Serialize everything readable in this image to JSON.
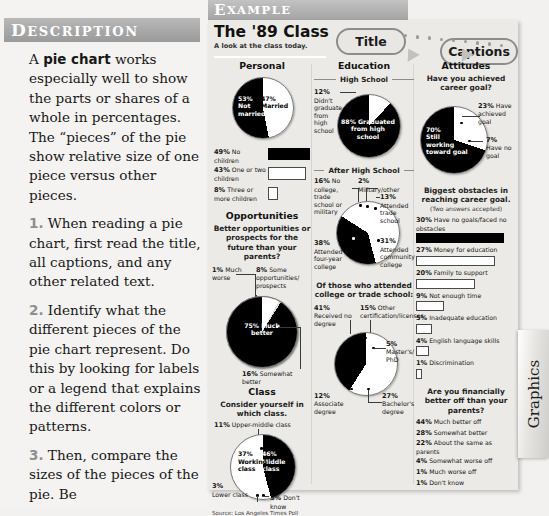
{
  "left": {
    "header": "DESCRIPTION",
    "paragraphs": [
      {
        "num": "",
        "html": "A <b>pie chart</b> works especially well to show the parts or shares of a whole in percentages. The “pieces” of the pie show relative size of one piece versus other pieces."
      },
      {
        "num": "1.",
        "html": "When reading a pie chart, first read the title, all captions, and any other related text."
      },
      {
        "num": "2.",
        "html": "Identify what the different pieces of the pie chart represent. Do this by looking for labels or a legend that explains the different colors or patterns."
      },
      {
        "num": "3.",
        "html": "Then, compare the sizes of the pieces of the pie. Be"
      }
    ]
  },
  "example": {
    "header": "EXAMPLE",
    "title": "The '89 Class",
    "subtitle": "A look at the class today.",
    "callouts": {
      "title_bubble": "Title",
      "captions_bubble": "Captions"
    },
    "source": "Source: Los Angeles Times Poll",
    "tab_label": "Graphics"
  },
  "chart_data": [
    {
      "type": "pie",
      "group": "Personal",
      "title": "Personal",
      "labels": [
        "47% Married",
        "53% Not married"
      ],
      "values": [
        47,
        53
      ],
      "colors": [
        "#ffffff",
        "#000000"
      ]
    },
    {
      "type": "bar",
      "group": "Personal",
      "title": "",
      "categories": [
        "49% No children",
        "43% One or two children",
        "8% Three or more children"
      ],
      "values": [
        49,
        43,
        8
      ],
      "pcts": [
        "49%",
        "43%",
        "8%"
      ],
      "texts": [
        "No children",
        "One or two children",
        "Three or more children"
      ],
      "fills": [
        "#000000",
        "#ffffff",
        "#ffffff"
      ]
    },
    {
      "type": "pie",
      "group": "Opportunities",
      "title": "Opportunities",
      "question": "Better opportunities or prospects for the future than your parents?",
      "labels": [
        "75% Much better",
        "16% Somewhat better",
        "8% Some opportunities/prospects",
        "1% Much worse"
      ],
      "values": [
        75,
        16,
        8,
        1
      ],
      "colors": [
        "#000000",
        "#ffffff",
        "#ffffff",
        "#ffffff"
      ]
    },
    {
      "type": "pie",
      "group": "Class",
      "title": "Class",
      "question": "Consider yourself in which class.",
      "labels": [
        "46% Middle class",
        "37% Working class",
        "11% Upper-middle class",
        "3% Lower class",
        "3% Don't know"
      ],
      "values": [
        46,
        37,
        11,
        3,
        3
      ],
      "colors": [
        "#000000",
        "#ffffff",
        "#ffffff",
        "#ffffff",
        "#ffffff"
      ]
    },
    {
      "type": "pie",
      "group": "Education",
      "title": "Education",
      "subhead": "High School",
      "labels": [
        "88% Graduated from high school",
        "12% Didn't graduate from high school"
      ],
      "values": [
        88,
        12
      ],
      "colors": [
        "#000000",
        "#ffffff"
      ]
    },
    {
      "type": "pie",
      "group": "Education",
      "subhead": "After High School",
      "labels": [
        "38% Attended a four-year college",
        "31% Attended community college",
        "16% No college, trade school or military",
        "13% Attended trade school",
        "2% Military/other"
      ],
      "values": [
        38,
        31,
        16,
        13,
        2
      ],
      "colors": [
        "#000000",
        "#ffffff",
        "#ffffff",
        "#ffffff",
        "#ffffff"
      ]
    },
    {
      "type": "pie",
      "group": "Education",
      "question": "Of those who attended college or trade school:",
      "labels": [
        "41% Received no degree",
        "27% Bachelor's degree",
        "15% Other certification/licenses",
        "12% Associate degree",
        "5% Master's/PhD"
      ],
      "values": [
        41,
        27,
        15,
        12,
        5
      ],
      "colors": [
        "#000000",
        "#ffffff",
        "#ffffff",
        "#ffffff",
        "#ffffff"
      ]
    },
    {
      "type": "pie",
      "group": "Attitudes",
      "title": "Attitudes",
      "question": "Have you achieved career goal?",
      "labels": [
        "70% Still working toward goal",
        "23% Have achieved goal",
        "7% Have no goal"
      ],
      "values": [
        70,
        23,
        7
      ],
      "colors": [
        "#000000",
        "#ffffff",
        "#ffffff"
      ]
    },
    {
      "type": "bar",
      "group": "Attitudes",
      "question": "Biggest obstacles in reaching career goal.",
      "question_note": "(Two answers accepted)",
      "categories": [
        "30% Have no goals/faced no obstacles",
        "27% Money for education",
        "20% Family to support",
        "9% Not enough time",
        "5% Inadequate education",
        "4% English language skills",
        "1% Discrimination"
      ],
      "values": [
        30,
        27,
        20,
        9,
        5,
        4,
        1
      ],
      "pcts": [
        "30%",
        "27%",
        "20%",
        "9%",
        "5%",
        "4%",
        "1%"
      ],
      "texts": [
        "Have no goals/faced no obstacles",
        "Money for education",
        "Family to support",
        "Not enough time",
        "Inadequate education",
        "English language skills",
        "Discrimination"
      ],
      "fills": [
        "#000000",
        "#ffffff",
        "#ffffff",
        "#ffffff",
        "#ffffff",
        "#ffffff",
        "#ffffff"
      ]
    },
    {
      "type": "table",
      "group": "Attitudes",
      "question": "Are you financially better off than your parents?",
      "categories": [
        "44% Much better off",
        "28% Somewhat better",
        "22% About the same as parents",
        "4% Somewhat worse off",
        "1% Much worse off",
        "1% Don't know"
      ],
      "values": [
        44,
        28,
        22,
        4,
        1,
        1
      ]
    }
  ]
}
